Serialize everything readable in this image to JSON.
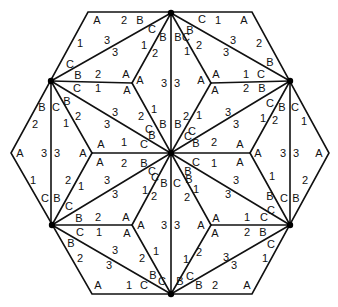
{
  "diagram": {
    "type": "hexagonal tiling with labeled triangle corners",
    "colors": {
      "line": "#111111",
      "background": "#ffffff",
      "vertex": "#000000"
    },
    "outer_hexagon": [
      [
        88,
        12
      ],
      [
        252,
        12
      ],
      [
        329,
        153
      ],
      [
        252,
        294
      ],
      [
        92,
        294
      ],
      [
        11,
        153
      ]
    ],
    "dark_vertices": [
      [
        171,
        13
      ],
      [
        290,
        81
      ],
      [
        290,
        225
      ],
      [
        171,
        294
      ],
      [
        52,
        225
      ],
      [
        51,
        81
      ],
      [
        171,
        153
      ]
    ],
    "edges": [
      [
        [
          171,
          13
        ],
        [
          171,
          294
        ]
      ],
      [
        [
          51,
          81
        ],
        [
          290,
          225
        ]
      ],
      [
        [
          290,
          81
        ],
        [
          52,
          225
        ]
      ],
      [
        [
          51,
          81
        ],
        [
          51,
          225
        ]
      ],
      [
        [
          290,
          81
        ],
        [
          290,
          225
        ]
      ],
      [
        [
          51,
          81
        ],
        [
          171,
          13
        ]
      ],
      [
        [
          171,
          13
        ],
        [
          290,
          81
        ]
      ],
      [
        [
          52,
          225
        ],
        [
          171,
          294
        ]
      ],
      [
        [
          171,
          294
        ],
        [
          290,
          225
        ]
      ],
      [
        [
          51,
          81
        ],
        [
          132,
          83
        ]
      ],
      [
        [
          132,
          83
        ],
        [
          171,
          13
        ]
      ],
      [
        [
          132,
          83
        ],
        [
          171,
          153
        ]
      ],
      [
        [
          211,
          83
        ],
        [
          290,
          81
        ]
      ],
      [
        [
          211,
          83
        ],
        [
          171,
          13
        ]
      ],
      [
        [
          211,
          83
        ],
        [
          171,
          153
        ]
      ],
      [
        [
          52,
          225
        ],
        [
          132,
          225
        ]
      ],
      [
        [
          132,
          225
        ],
        [
          171,
          294
        ]
      ],
      [
        [
          132,
          225
        ],
        [
          171,
          153
        ]
      ],
      [
        [
          211,
          225
        ],
        [
          290,
          225
        ]
      ],
      [
        [
          211,
          225
        ],
        [
          171,
          294
        ]
      ],
      [
        [
          211,
          225
        ],
        [
          171,
          153
        ]
      ],
      [
        [
          92,
          153
        ],
        [
          171,
          153
        ]
      ],
      [
        [
          92,
          153
        ],
        [
          51,
          81
        ]
      ],
      [
        [
          92,
          153
        ],
        [
          52,
          225
        ]
      ],
      [
        [
          250,
          153
        ],
        [
          171,
          153
        ]
      ],
      [
        [
          250,
          153
        ],
        [
          290,
          81
        ]
      ],
      [
        [
          250,
          153
        ],
        [
          290,
          225
        ]
      ]
    ],
    "labels": [
      {
        "t": "A",
        "x": 97,
        "y": 20
      },
      {
        "t": "2",
        "x": 124,
        "y": 20
      },
      {
        "t": "B",
        "x": 140,
        "y": 20
      },
      {
        "t": "C",
        "x": 202,
        "y": 19
      },
      {
        "t": "1",
        "x": 218,
        "y": 20
      },
      {
        "t": "A",
        "x": 244,
        "y": 20
      },
      {
        "t": "1",
        "x": 80,
        "y": 43
      },
      {
        "t": "3",
        "x": 107,
        "y": 40
      },
      {
        "t": "C",
        "x": 152,
        "y": 29
      },
      {
        "t": "B",
        "x": 163,
        "y": 37
      },
      {
        "t": "3",
        "x": 115,
        "y": 52
      },
      {
        "t": "1",
        "x": 144,
        "y": 45
      },
      {
        "t": "2",
        "x": 155,
        "y": 53
      },
      {
        "t": "B",
        "x": 178,
        "y": 37
      },
      {
        "t": "C",
        "x": 186,
        "y": 37
      },
      {
        "t": "B",
        "x": 190,
        "y": 30
      },
      {
        "t": "2",
        "x": 199,
        "y": 45
      },
      {
        "t": "3",
        "x": 233,
        "y": 40
      },
      {
        "t": "2",
        "x": 259,
        "y": 43
      },
      {
        "t": "1",
        "x": 187,
        "y": 51
      },
      {
        "t": "3",
        "x": 226,
        "y": 52
      },
      {
        "t": "C",
        "x": 70,
        "y": 64
      },
      {
        "t": "B",
        "x": 270,
        "y": 62
      },
      {
        "t": "B",
        "x": 78,
        "y": 75
      },
      {
        "t": "2",
        "x": 98,
        "y": 74
      },
      {
        "t": "A",
        "x": 126,
        "y": 74
      },
      {
        "t": "A",
        "x": 140,
        "y": 80
      },
      {
        "t": "3",
        "x": 164,
        "y": 83
      },
      {
        "t": "3",
        "x": 177,
        "y": 83
      },
      {
        "t": "A",
        "x": 201,
        "y": 80
      },
      {
        "t": "A",
        "x": 216,
        "y": 74
      },
      {
        "t": "1",
        "x": 246,
        "y": 74
      },
      {
        "t": "C",
        "x": 261,
        "y": 74
      },
      {
        "t": "C",
        "x": 77,
        "y": 88
      },
      {
        "t": "1",
        "x": 98,
        "y": 88
      },
      {
        "t": "A",
        "x": 127,
        "y": 90
      },
      {
        "t": "A",
        "x": 215,
        "y": 90
      },
      {
        "t": "2",
        "x": 246,
        "y": 88
      },
      {
        "t": "B",
        "x": 262,
        "y": 88
      },
      {
        "t": "B",
        "x": 42,
        "y": 107
      },
      {
        "t": "C",
        "x": 56,
        "y": 107
      },
      {
        "t": "B",
        "x": 67,
        "y": 101
      },
      {
        "t": "C",
        "x": 270,
        "y": 103
      },
      {
        "t": "B",
        "x": 282,
        "y": 107
      },
      {
        "t": "C",
        "x": 295,
        "y": 107
      },
      {
        "t": "2",
        "x": 35,
        "y": 124
      },
      {
        "t": "1",
        "x": 66,
        "y": 123
      },
      {
        "t": "2",
        "x": 78,
        "y": 116
      },
      {
        "t": "3",
        "x": 115,
        "y": 112
      },
      {
        "t": "3",
        "x": 107,
        "y": 124
      },
      {
        "t": "2",
        "x": 141,
        "y": 116
      },
      {
        "t": "1",
        "x": 154,
        "y": 109
      },
      {
        "t": "2",
        "x": 186,
        "y": 116
      },
      {
        "t": "1",
        "x": 199,
        "y": 115
      },
      {
        "t": "3",
        "x": 228,
        "y": 112
      },
      {
        "t": "3",
        "x": 236,
        "y": 124
      },
      {
        "t": "1",
        "x": 263,
        "y": 118
      },
      {
        "t": "2",
        "x": 275,
        "y": 120
      },
      {
        "t": "1",
        "x": 304,
        "y": 121
      },
      {
        "t": "C",
        "x": 149,
        "y": 129
      },
      {
        "t": "B",
        "x": 163,
        "y": 124
      },
      {
        "t": "B",
        "x": 178,
        "y": 124
      },
      {
        "t": "C",
        "x": 192,
        "y": 131
      },
      {
        "t": "B",
        "x": 152,
        "y": 135
      },
      {
        "t": "C",
        "x": 188,
        "y": 136
      },
      {
        "t": "1",
        "x": 124,
        "y": 142
      },
      {
        "t": "C",
        "x": 144,
        "y": 144
      },
      {
        "t": "B",
        "x": 196,
        "y": 143
      },
      {
        "t": "2",
        "x": 214,
        "y": 142
      },
      {
        "t": "A",
        "x": 20,
        "y": 153
      },
      {
        "t": "3",
        "x": 44,
        "y": 153
      },
      {
        "t": "3",
        "x": 57,
        "y": 153
      },
      {
        "t": "A",
        "x": 83,
        "y": 153
      },
      {
        "t": "A",
        "x": 101,
        "y": 144
      },
      {
        "t": "A",
        "x": 100,
        "y": 162
      },
      {
        "t": "A",
        "x": 240,
        "y": 144
      },
      {
        "t": "A",
        "x": 240,
        "y": 162
      },
      {
        "t": "A",
        "x": 258,
        "y": 153
      },
      {
        "t": "3",
        "x": 283,
        "y": 153
      },
      {
        "t": "3",
        "x": 296,
        "y": 153
      },
      {
        "t": "A",
        "x": 319,
        "y": 153
      },
      {
        "t": "2",
        "x": 124,
        "y": 163
      },
      {
        "t": "B",
        "x": 144,
        "y": 163
      },
      {
        "t": "C",
        "x": 196,
        "y": 162
      },
      {
        "t": "1",
        "x": 214,
        "y": 163
      },
      {
        "t": "C",
        "x": 152,
        "y": 171
      },
      {
        "t": "B",
        "x": 188,
        "y": 171
      },
      {
        "t": "C",
        "x": 155,
        "y": 177
      },
      {
        "t": "B",
        "x": 164,
        "y": 183
      },
      {
        "t": "C",
        "x": 177,
        "y": 183
      },
      {
        "t": "B",
        "x": 189,
        "y": 179
      },
      {
        "t": "1",
        "x": 33,
        "y": 180
      },
      {
        "t": "2",
        "x": 68,
        "y": 180
      },
      {
        "t": "1",
        "x": 81,
        "y": 186
      },
      {
        "t": "3",
        "x": 107,
        "y": 180
      },
      {
        "t": "3",
        "x": 115,
        "y": 194
      },
      {
        "t": "1",
        "x": 145,
        "y": 190
      },
      {
        "t": "2",
        "x": 154,
        "y": 196
      },
      {
        "t": "2",
        "x": 187,
        "y": 197
      },
      {
        "t": "1",
        "x": 196,
        "y": 189
      },
      {
        "t": "3",
        "x": 228,
        "y": 194
      },
      {
        "t": "3",
        "x": 236,
        "y": 180
      },
      {
        "t": "1",
        "x": 272,
        "y": 176
      },
      {
        "t": "2",
        "x": 305,
        "y": 180
      },
      {
        "t": "C",
        "x": 45,
        "y": 198
      },
      {
        "t": "B",
        "x": 57,
        "y": 198
      },
      {
        "t": "C",
        "x": 69,
        "y": 206
      },
      {
        "t": "B",
        "x": 270,
        "y": 196
      },
      {
        "t": "C",
        "x": 284,
        "y": 198
      },
      {
        "t": "B",
        "x": 296,
        "y": 198
      },
      {
        "t": "C",
        "x": 271,
        "y": 210
      },
      {
        "t": "B",
        "x": 79,
        "y": 218
      },
      {
        "t": "2",
        "x": 98,
        "y": 217
      },
      {
        "t": "A",
        "x": 126,
        "y": 217
      },
      {
        "t": "A",
        "x": 141,
        "y": 225
      },
      {
        "t": "3",
        "x": 164,
        "y": 225
      },
      {
        "t": "3",
        "x": 177,
        "y": 225
      },
      {
        "t": "A",
        "x": 201,
        "y": 225
      },
      {
        "t": "A",
        "x": 216,
        "y": 218
      },
      {
        "t": "1",
        "x": 247,
        "y": 217
      },
      {
        "t": "C",
        "x": 264,
        "y": 217
      },
      {
        "t": "C",
        "x": 80,
        "y": 232
      },
      {
        "t": "1",
        "x": 99,
        "y": 232
      },
      {
        "t": "A",
        "x": 127,
        "y": 233
      },
      {
        "t": "A",
        "x": 215,
        "y": 233
      },
      {
        "t": "2",
        "x": 247,
        "y": 232
      },
      {
        "t": "B",
        "x": 263,
        "y": 232
      },
      {
        "t": "B",
        "x": 71,
        "y": 243
      },
      {
        "t": "2",
        "x": 80,
        "y": 258
      },
      {
        "t": "3",
        "x": 115,
        "y": 250
      },
      {
        "t": "3",
        "x": 109,
        "y": 265
      },
      {
        "t": "2",
        "x": 142,
        "y": 258
      },
      {
        "t": "1",
        "x": 156,
        "y": 251
      },
      {
        "t": "1",
        "x": 186,
        "y": 259
      },
      {
        "t": "2",
        "x": 199,
        "y": 252
      },
      {
        "t": "3",
        "x": 226,
        "y": 257
      },
      {
        "t": "3",
        "x": 234,
        "y": 265
      },
      {
        "t": "1",
        "x": 265,
        "y": 258
      },
      {
        "t": "C",
        "x": 271,
        "y": 244
      },
      {
        "t": "B",
        "x": 153,
        "y": 275
      },
      {
        "t": "C",
        "x": 162,
        "y": 281
      },
      {
        "t": "B",
        "x": 180,
        "y": 281
      },
      {
        "t": "C",
        "x": 190,
        "y": 276
      },
      {
        "t": "A",
        "x": 98,
        "y": 285
      },
      {
        "t": "1",
        "x": 129,
        "y": 285
      },
      {
        "t": "C",
        "x": 144,
        "y": 285
      },
      {
        "t": "B",
        "x": 199,
        "y": 285
      },
      {
        "t": "2",
        "x": 215,
        "y": 285
      },
      {
        "t": "A",
        "x": 247,
        "y": 285
      }
    ]
  }
}
